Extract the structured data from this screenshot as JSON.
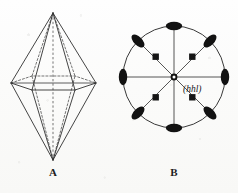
{
  "figure": {
    "kind": "crystallography-diagram",
    "background_color": "#fdfdfc",
    "ink_color": "#1d1d1d",
    "panels": [
      {
        "id": "A",
        "label": "A",
        "name": "hexagonal-bipyramid-crystal",
        "description": "Hexagonal bipyramid crystal drawing with solid front edges and dashed hidden back edges"
      },
      {
        "id": "B",
        "label": "B",
        "name": "stereographic-projection",
        "description": "Stereographic projection of the hexagonal bipyramid showing face poles"
      }
    ]
  },
  "panel_a": {
    "label": "A",
    "top_apex": {
      "x": 53,
      "y": 13
    },
    "bottom_apex": {
      "x": 53,
      "y": 160
    },
    "equator_vertices": [
      {
        "name": "left",
        "x": 11,
        "y": 83,
        "hidden": false
      },
      {
        "name": "front-left",
        "x": 32,
        "y": 90,
        "hidden": false
      },
      {
        "name": "front-right",
        "x": 75,
        "y": 90,
        "hidden": false
      },
      {
        "name": "right",
        "x": 96,
        "y": 83,
        "hidden": false
      },
      {
        "name": "back-right",
        "x": 75,
        "y": 76,
        "hidden": true
      },
      {
        "name": "back-left",
        "x": 32,
        "y": 76,
        "hidden": true
      }
    ],
    "vertical_axis": {
      "x": 53,
      "top_y": 13,
      "bottom_y": 160,
      "style": "dashed"
    }
  },
  "panel_b": {
    "label": "B",
    "index_label": "(hhl)",
    "primitive_circle": {
      "cx": 174,
      "cy": 77,
      "r": 51
    },
    "center_pole": {
      "x": 174,
      "y": 77,
      "symbol": "center-dot",
      "style": "filled-dot-with-open-center"
    },
    "radial_lines_count": 8,
    "perimeter_poles": {
      "symbol": "filled-ellipse",
      "count": 8,
      "angles_deg": [
        0,
        45,
        90,
        135,
        180,
        225,
        270,
        315
      ]
    },
    "interior_poles": {
      "symbol": "filled-square",
      "count": 4,
      "radius_fraction": 0.42,
      "angles_deg": [
        45,
        135,
        225,
        315
      ]
    }
  },
  "legend_semantics": {
    "filled_ellipse": "upper-hemisphere face pole on primitive",
    "filled_square": "face pole of pyramid form",
    "center_dot": "pole of basal direction / c-axis"
  }
}
